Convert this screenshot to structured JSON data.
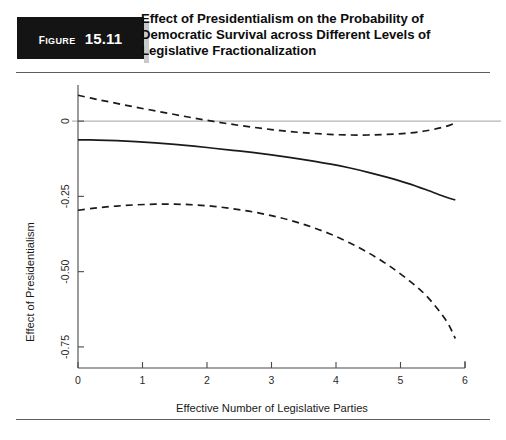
{
  "header": {
    "figure_word": "Figure",
    "figure_number": "15.11",
    "title": "Effect of Presidentialism on the Probability of Democratic Survival across Different Levels of Legislative Fractionalization",
    "title_line1": "Effect of Presidentialism on the Probability of",
    "title_line2": "Democratic Survival across Different Levels of",
    "title_line3": "Legislative Fractionalization",
    "badge_background": "#141414",
    "badge_text_color": "#ffffff"
  },
  "chart_data": {
    "type": "line",
    "title": "Effect of Presidentialism on the Probability of Democratic Survival across Different Levels of Legislative Fractionalization",
    "xlabel": "Effective Number of Legislative Parties",
    "ylabel": "Effect of Presidentialism",
    "xlim": [
      0,
      6
    ],
    "ylim": [
      -0.82,
      0.12
    ],
    "xticks": [
      0,
      1,
      2,
      3,
      4,
      5,
      6
    ],
    "xticklabels": [
      "0",
      "1",
      "2",
      "3",
      "4",
      "5",
      "6"
    ],
    "yticks": [
      0,
      -0.25,
      -0.5,
      -0.75
    ],
    "yticklabels": [
      "0",
      "-0.25",
      "-0.50",
      "-0.75"
    ],
    "grid": false,
    "legend": false,
    "reference_line": {
      "y": 0,
      "color": "#b6b6b6",
      "style": "solid"
    },
    "x": [
      0.0,
      0.3,
      0.6,
      0.9,
      1.2,
      1.5,
      1.8,
      2.1,
      2.4,
      2.7,
      3.0,
      3.3,
      3.6,
      3.9,
      4.2,
      4.5,
      4.8,
      5.1,
      5.4,
      5.7,
      5.85
    ],
    "series": [
      {
        "name": "Point estimate",
        "style": "solid",
        "color": "#1a1a1a",
        "values": [
          -0.062,
          -0.063,
          -0.065,
          -0.068,
          -0.072,
          -0.077,
          -0.083,
          -0.09,
          -0.097,
          -0.104,
          -0.112,
          -0.121,
          -0.131,
          -0.142,
          -0.155,
          -0.17,
          -0.187,
          -0.206,
          -0.228,
          -0.252,
          -0.262
        ]
      },
      {
        "name": "Upper 95% confidence bound",
        "style": "dashed",
        "color": "#1a1a1a",
        "values": [
          0.086,
          0.072,
          0.059,
          0.046,
          0.034,
          0.022,
          0.01,
          -0.001,
          -0.011,
          -0.02,
          -0.028,
          -0.035,
          -0.04,
          -0.044,
          -0.046,
          -0.046,
          -0.044,
          -0.04,
          -0.032,
          -0.018,
          -0.006
        ]
      },
      {
        "name": "Lower 95% confidence bound",
        "style": "dashed",
        "color": "#1a1a1a",
        "values": [
          -0.296,
          -0.288,
          -0.282,
          -0.278,
          -0.276,
          -0.276,
          -0.278,
          -0.283,
          -0.291,
          -0.301,
          -0.314,
          -0.33,
          -0.35,
          -0.374,
          -0.403,
          -0.437,
          -0.477,
          -0.524,
          -0.58,
          -0.66,
          -0.722
        ]
      }
    ]
  }
}
